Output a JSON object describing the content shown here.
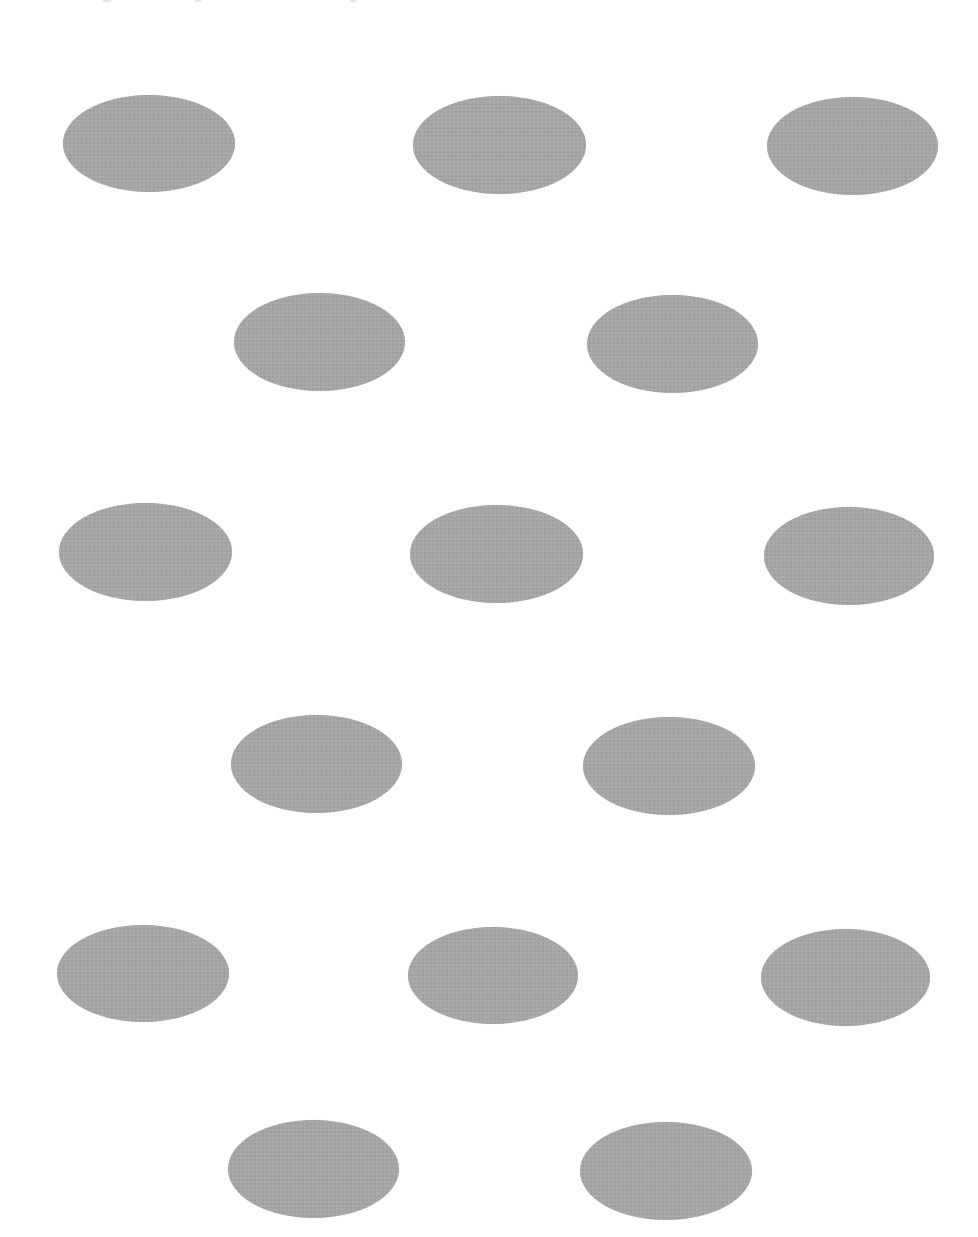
{
  "page": {
    "background": "#ffffff",
    "width": 978,
    "height": 1237
  },
  "shape_style": {
    "fill": "#a7a7a7",
    "shape": "ellipse"
  },
  "top_clipped_text_fragments": [
    {
      "x": 103,
      "w": 8
    },
    {
      "x": 195,
      "w": 6
    },
    {
      "x": 350,
      "w": 6
    }
  ],
  "rows": [
    {
      "row": 1,
      "ellipses": [
        {
          "x": 63,
          "y": 95,
          "w": 172,
          "h": 97
        },
        {
          "x": 413,
          "y": 96,
          "w": 173,
          "h": 98
        },
        {
          "x": 767,
          "y": 97,
          "w": 171,
          "h": 98
        }
      ]
    },
    {
      "row": 2,
      "ellipses": [
        {
          "x": 234,
          "y": 293,
          "w": 171,
          "h": 98
        },
        {
          "x": 587,
          "y": 295,
          "w": 171,
          "h": 98
        }
      ]
    },
    {
      "row": 3,
      "ellipses": [
        {
          "x": 59,
          "y": 503,
          "w": 173,
          "h": 98
        },
        {
          "x": 410,
          "y": 505,
          "w": 173,
          "h": 98
        },
        {
          "x": 764,
          "y": 507,
          "w": 170,
          "h": 98
        }
      ]
    },
    {
      "row": 4,
      "ellipses": [
        {
          "x": 231,
          "y": 715,
          "w": 171,
          "h": 98
        },
        {
          "x": 583,
          "y": 717,
          "w": 172,
          "h": 98
        }
      ]
    },
    {
      "row": 5,
      "ellipses": [
        {
          "x": 57,
          "y": 925,
          "w": 172,
          "h": 97
        },
        {
          "x": 408,
          "y": 927,
          "w": 170,
          "h": 97
        },
        {
          "x": 761,
          "y": 929,
          "w": 169,
          "h": 97
        }
      ]
    },
    {
      "row": 6,
      "ellipses": [
        {
          "x": 228,
          "y": 1120,
          "w": 171,
          "h": 98
        },
        {
          "x": 580,
          "y": 1122,
          "w": 172,
          "h": 98
        }
      ]
    }
  ],
  "total_ellipses": 15
}
